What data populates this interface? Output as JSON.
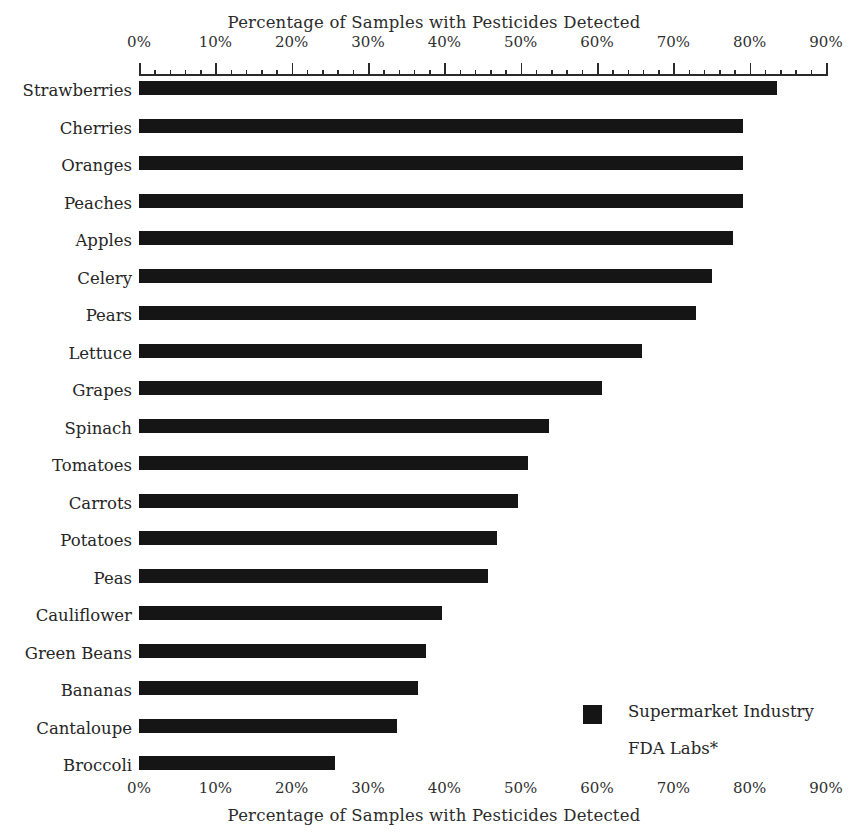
{
  "chart_data": {
    "type": "bar",
    "orientation": "horizontal",
    "title": "Percentage of Samples with Pesticides Detected",
    "xlabel": "Percentage of Samples with Pesticides Detected",
    "ylabel": "",
    "top_axis_title": "Percentage of Samples with Pesticides Detected",
    "bottom_axis_title": "Percentage of Samples with Pesticides Detected",
    "xlim": [
      0,
      90
    ],
    "xtick_labels": [
      "0%",
      "10%",
      "20%",
      "30%",
      "40%",
      "50%",
      "60%",
      "70%",
      "80%",
      "90%"
    ],
    "xtick_values": [
      0,
      10,
      20,
      30,
      40,
      50,
      60,
      70,
      80,
      90
    ],
    "minor_tick_interval": 2,
    "grid": false,
    "legend_position": "bottom-right",
    "categories": [
      "Strawberries",
      "Cherries",
      "Oranges",
      "Peaches",
      "Apples",
      "Celery",
      "Pears",
      "Lettuce",
      "Grapes",
      "Spinach",
      "Tomatoes",
      "Carrots",
      "Potatoes",
      "Peas",
      "Cauliflower",
      "Green Beans",
      "Bananas",
      "Cantaloupe",
      "Broccoli"
    ],
    "series": [
      {
        "name": "Supermarket Industry",
        "color": "#151515",
        "values": [
          83.6,
          79.1,
          79.1,
          79.1,
          77.8,
          75.1,
          73.0,
          65.9,
          60.7,
          53.7,
          51.0,
          49.7,
          46.9,
          45.7,
          39.7,
          37.6,
          36.6,
          33.8,
          25.7
        ]
      },
      {
        "name": "FDA Labs*",
        "color": "#ffffff",
        "values": [
          0,
          0,
          0,
          0,
          0,
          0,
          0,
          0,
          0,
          0,
          0,
          0,
          0,
          0,
          0,
          0,
          0,
          0,
          0
        ]
      }
    ],
    "legend": [
      {
        "label": "Supermarket Industry",
        "swatch": "filled",
        "color": "#151515"
      },
      {
        "label": "FDA Labs*",
        "swatch": "empty",
        "color": "#ffffff"
      }
    ],
    "axis": {
      "x0_px": 139,
      "x90_px": 826,
      "row_top_px": 79,
      "row_step_px": 37.5
    }
  }
}
